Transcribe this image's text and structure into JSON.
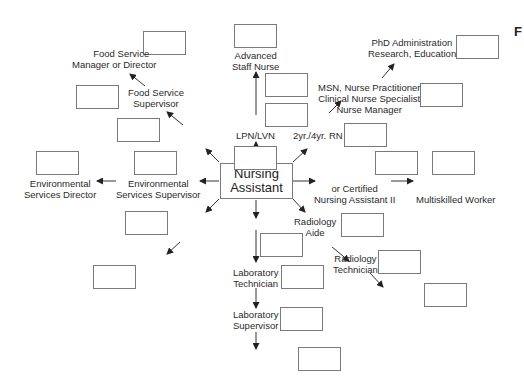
{
  "diagram": {
    "type": "career-ladder",
    "center": {
      "line1": "Nursing",
      "line2": "Assistant"
    },
    "page_letter": "F",
    "nodes": {
      "food_service_manager": {
        "line1": "Food Service",
        "line2": "Manager or Director"
      },
      "food_service_supervisor": {
        "line1": "Food Service",
        "line2": "Supervisor"
      },
      "advanced_staff_nurse": {
        "line1": "Advanced",
        "line2": "Staff Nurse"
      },
      "phd": {
        "line1": "PhD Administration",
        "line2": "Research, Education"
      },
      "msn": {
        "line1": "MSN, Nurse Practitioner",
        "line2": "Clinical Nurse Specialist",
        "line3": "Nurse Manager"
      },
      "rn": {
        "line1": "2yr./4yr. RN"
      },
      "lpn": {
        "line1": "LPN/LVN"
      },
      "env_director": {
        "line1": "Environmental",
        "line2": "Services Director"
      },
      "env_supervisor": {
        "line1": "Environmental",
        "line2": "Services Supervisor"
      },
      "cna2": {
        "line1": "or Certified",
        "line2": "Nursing Assistant II"
      },
      "multiskilled": {
        "line1": "Multiskilled Worker"
      },
      "radiology_aide": {
        "line1": "Radiology",
        "line2": "Aide"
      },
      "radiology_technician": {
        "line1": "Radiology",
        "line2": "Technician"
      },
      "lab_technician": {
        "line1": "Laboratory",
        "line2": "Technician"
      },
      "lab_supervisor": {
        "line1": "Laboratory",
        "line2": "Supervisor"
      }
    },
    "blank_box_count": 22
  }
}
